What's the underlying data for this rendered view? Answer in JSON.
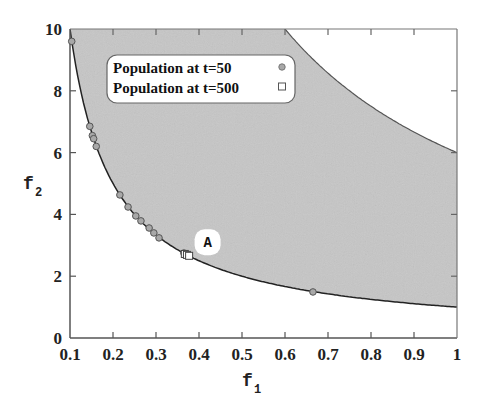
{
  "chart_data": {
    "type": "scatter",
    "title": "",
    "xlabel": "f",
    "xlabel_sub": "1",
    "ylabel": "f",
    "ylabel_sub": "2",
    "xlim": [
      0.1,
      1
    ],
    "ylim": [
      0,
      10
    ],
    "xticks": [
      "0.1",
      "0.2",
      "0.3",
      "0.4",
      "0.5",
      "0.6",
      "0.7",
      "0.8",
      "0.9",
      "1"
    ],
    "xtick_values": [
      0.1,
      0.2,
      0.3,
      0.4,
      0.5,
      0.6,
      0.7,
      0.8,
      0.9,
      1.0
    ],
    "yticks": [
      "0",
      "2",
      "4",
      "6",
      "8",
      "10"
    ],
    "ytick_values": [
      0,
      2,
      4,
      6,
      8,
      10
    ],
    "grid": false,
    "legend_position": "upper-left-inside",
    "feasible_region": {
      "description": "shaded region between lower boundary f2 = 1/f1 and upper boundary f2 = 6/f1",
      "lower_boundary": "f2 = 1/f1",
      "upper_boundary": "f2 = 6/f1",
      "fill_color": "#c8c8c8"
    },
    "series": [
      {
        "name": "Population at t=50",
        "marker": "circle",
        "color": "#a8a8a8",
        "points": [
          [
            0.104,
            9.6
          ],
          [
            0.146,
            6.85
          ],
          [
            0.152,
            6.55
          ],
          [
            0.155,
            6.45
          ],
          [
            0.161,
            6.2
          ],
          [
            0.216,
            4.63
          ],
          [
            0.235,
            4.24
          ],
          [
            0.253,
            3.95
          ],
          [
            0.265,
            3.79
          ],
          [
            0.284,
            3.56
          ],
          [
            0.295,
            3.4
          ],
          [
            0.307,
            3.24
          ],
          [
            0.365,
            2.75
          ],
          [
            0.665,
            1.49
          ]
        ]
      },
      {
        "name": "Population at t=500",
        "marker": "square",
        "color": "#ffffff",
        "points": [
          [
            0.367,
            2.72
          ],
          [
            0.372,
            2.69
          ],
          [
            0.377,
            2.66
          ]
        ]
      }
    ],
    "annotations": [
      {
        "text": "A",
        "x": 0.42,
        "y": 3.1
      }
    ]
  },
  "legend": {
    "items": [
      {
        "label": "Population at t=50",
        "marker": "circle"
      },
      {
        "label": "Population at t=500",
        "marker": "square"
      }
    ]
  },
  "annotation_label": "A"
}
